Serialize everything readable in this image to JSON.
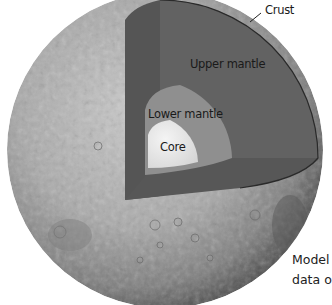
{
  "diagram": {
    "labels": {
      "crust": "Crust",
      "upper_mantle": "Upper mantle",
      "lower_mantle": "Lower mantle",
      "core": "Core"
    },
    "caption": {
      "line1": "Model",
      "line2": "data o"
    },
    "colors": {
      "surface_light": "#bdbdbd",
      "surface_dark": "#6e6e6e",
      "upper_mantle": "#5f5f5f",
      "upper_mantle_side": "#555555",
      "lower_mantle": "#8f8f8f",
      "core": "#e6e6e6",
      "crust_line": "#2a2a2a"
    }
  }
}
